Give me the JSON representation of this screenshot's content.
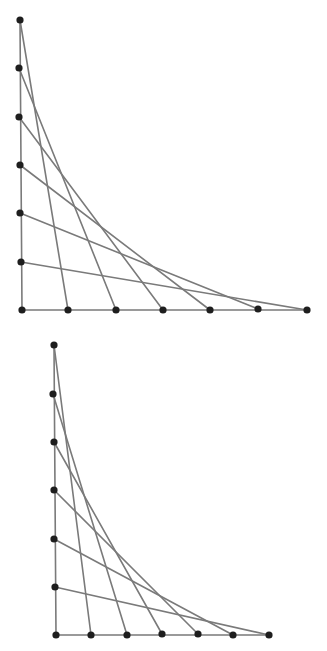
{
  "style": {
    "line_color": "#7a7a7a",
    "dot_color": "#1e1e1e",
    "background": "#ffffff",
    "line_width": 1.6,
    "dot_radius": 3.6
  },
  "figures": [
    {
      "name": "string-art-top",
      "vertical_points": [
        [
          20,
          20
        ],
        [
          19,
          68
        ],
        [
          19,
          117
        ],
        [
          20,
          165
        ],
        [
          20,
          213
        ],
        [
          21,
          262
        ],
        [
          22,
          310
        ]
      ],
      "horizontal_points": [
        [
          22,
          310
        ],
        [
          68,
          310
        ],
        [
          116,
          310
        ],
        [
          163,
          310
        ],
        [
          210,
          310
        ],
        [
          258,
          309
        ],
        [
          307,
          310
        ]
      ],
      "connections": [
        [
          0,
          1
        ],
        [
          1,
          2
        ],
        [
          2,
          3
        ],
        [
          3,
          4
        ],
        [
          4,
          5
        ],
        [
          5,
          6
        ]
      ]
    },
    {
      "name": "string-art-bottom",
      "vertical_points": [
        [
          54,
          345
        ],
        [
          53,
          394
        ],
        [
          54,
          442
        ],
        [
          54,
          490
        ],
        [
          54,
          539
        ],
        [
          55,
          587
        ],
        [
          56,
          635
        ]
      ],
      "horizontal_points": [
        [
          56,
          635
        ],
        [
          91,
          635
        ],
        [
          127,
          635
        ],
        [
          162,
          634
        ],
        [
          198,
          634
        ],
        [
          233,
          635
        ],
        [
          269,
          635
        ]
      ],
      "connections": [
        [
          0,
          1
        ],
        [
          1,
          2
        ],
        [
          2,
          3
        ],
        [
          3,
          4
        ],
        [
          4,
          5
        ],
        [
          5,
          6
        ]
      ]
    }
  ]
}
